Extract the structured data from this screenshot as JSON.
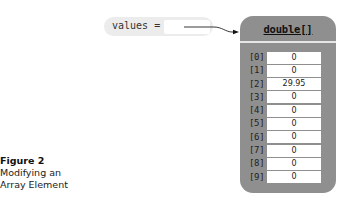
{
  "variable": {
    "name": "values",
    "label": "values ="
  },
  "array": {
    "type_label": "double[]",
    "elements": [
      {
        "index": "[0]",
        "value": "0"
      },
      {
        "index": "[1]",
        "value": "0"
      },
      {
        "index": "[2]",
        "value": "29.95"
      },
      {
        "index": "[3]",
        "value": "0"
      },
      {
        "index": "[4]",
        "value": "0"
      },
      {
        "index": "[5]",
        "value": "0"
      },
      {
        "index": "[6]",
        "value": "0"
      },
      {
        "index": "[7]",
        "value": "0"
      },
      {
        "index": "[8]",
        "value": "0"
      },
      {
        "index": "[9]",
        "value": "0"
      }
    ]
  },
  "caption": {
    "title": "Figure 2",
    "line1": "Modifying an",
    "line2": "Array Element"
  },
  "colors": {
    "box_fill": "#8f8f8f",
    "pill_fill": "#ececec",
    "separator": "#e6e6e6"
  }
}
